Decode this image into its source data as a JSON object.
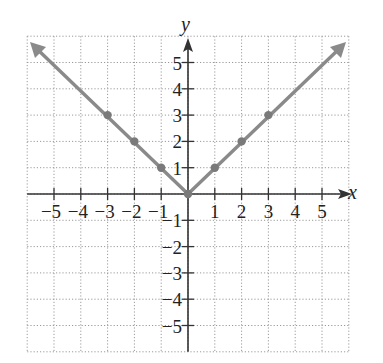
{
  "chart_data": {
    "type": "line",
    "title": "",
    "xlabel": "x",
    "ylabel": "y",
    "xlim": [
      -6,
      6
    ],
    "ylim": [
      -6,
      6
    ],
    "grid": true,
    "x_ticks": [
      -5,
      -4,
      -3,
      -2,
      -1,
      1,
      2,
      3,
      4,
      5
    ],
    "y_ticks": [
      -5,
      -4,
      -3,
      -2,
      -1,
      1,
      2,
      3,
      4,
      5
    ],
    "x_tick_labels": [
      "−5",
      "−4",
      "−3",
      "−2",
      "−1",
      "1",
      "2",
      "3",
      "4",
      "5"
    ],
    "y_tick_labels": [
      "−5",
      "−4",
      "−3",
      "−2",
      "−1",
      "1",
      "2",
      "3",
      "4",
      "5"
    ],
    "series": [
      {
        "name": "y = |x|",
        "color": "#8a8a8a",
        "x": [
          -6,
          -3,
          -2,
          -1,
          0,
          1,
          2,
          3,
          6
        ],
        "y": [
          6,
          3,
          2,
          1,
          0,
          1,
          2,
          3,
          6
        ],
        "arrows": "both-ends"
      }
    ],
    "points": [
      {
        "x": -3,
        "y": 3
      },
      {
        "x": -2,
        "y": 2
      },
      {
        "x": -1,
        "y": 1
      },
      {
        "x": 0,
        "y": 0
      },
      {
        "x": 1,
        "y": 1
      },
      {
        "x": 2,
        "y": 2
      },
      {
        "x": 3,
        "y": 3
      }
    ]
  },
  "colors": {
    "axis": "#333333",
    "grid": "#9a9a9a",
    "curve": "#8a8a8a",
    "point": "#7a7a7a"
  }
}
